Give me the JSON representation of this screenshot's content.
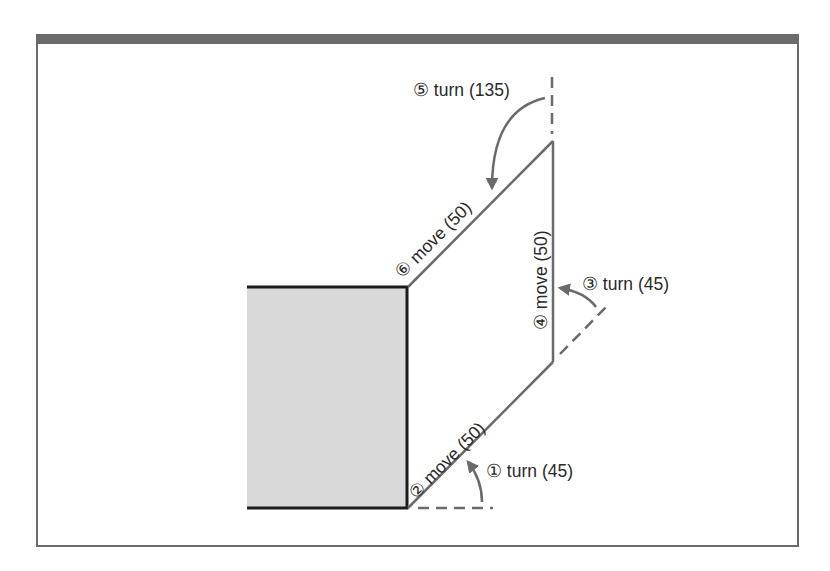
{
  "figure": {
    "kind": "turtle-graphics path diagram",
    "colors": {
      "frame": "#6b6b6b",
      "path": "#6a6a6a",
      "block_fill": "#d9d9d9",
      "block_border": "#1c1c1c",
      "text": "#2a2a2a"
    },
    "steps": [
      {
        "num": "①",
        "label": "① turn (45)",
        "command": "turn",
        "value": 45
      },
      {
        "num": "②",
        "label": "② move (50)",
        "command": "move",
        "value": 50
      },
      {
        "num": "③",
        "label": "③ turn (45)",
        "command": "turn",
        "value": 45
      },
      {
        "num": "④",
        "label": "④ move (50)",
        "command": "move",
        "value": 50
      },
      {
        "num": "⑤",
        "label": "⑤ turn (135)",
        "command": "turn",
        "value": 135
      },
      {
        "num": "⑥",
        "label": "⑥ move (50)",
        "command": "move",
        "value": 50
      }
    ]
  }
}
